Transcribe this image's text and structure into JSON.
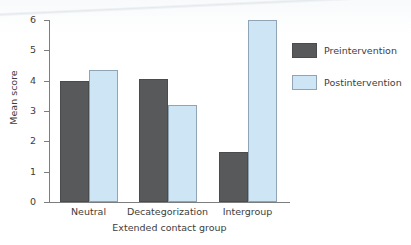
{
  "chart_data": {
    "type": "bar",
    "title": "",
    "subtitle": "",
    "xlabel": "Extended contact group",
    "ylabel": "Mean score",
    "categories": [
      "Neutral",
      "Decategorization",
      "Intergroup"
    ],
    "series": [
      {
        "name": "Preintervention",
        "color": "#58595b",
        "values": [
          4.0,
          4.05,
          1.65
        ]
      },
      {
        "name": "Postintervention",
        "color": "#cde5f5",
        "values": [
          4.35,
          3.2,
          6.0
        ]
      }
    ],
    "ylim": [
      0,
      6
    ],
    "ytick_labels": [
      "0",
      "1",
      "2",
      "3",
      "4",
      "5",
      "6"
    ],
    "ytick_values": [
      0,
      1,
      2,
      3,
      4,
      5,
      6
    ],
    "grid": false,
    "legend_position": "right",
    "axis_color": "#7d7d7d",
    "background_color": "#ffffff"
  },
  "legend": {
    "entries": [
      {
        "label": "Preintervention",
        "swatch": "preintervention-swatch"
      },
      {
        "label": "Postintervention",
        "swatch": "postintervention-swatch"
      }
    ]
  }
}
